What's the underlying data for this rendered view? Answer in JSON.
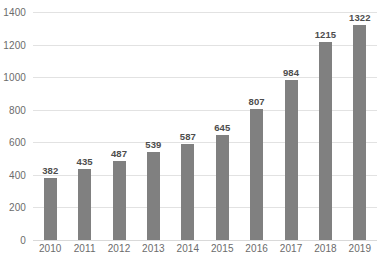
{
  "chart_data": {
    "type": "bar",
    "title": "",
    "subtitle": "",
    "xlabel": "",
    "ylabel": "",
    "categories": [
      "2010",
      "2011",
      "2012",
      "2013",
      "2014",
      "2015",
      "2016",
      "2017",
      "2018",
      "2019"
    ],
    "values": [
      382,
      435,
      487,
      539,
      587,
      645,
      807,
      984,
      1215,
      1322
    ],
    "data_labels": [
      "382",
      "435",
      "487",
      "539",
      "587",
      "645",
      "807",
      "984",
      "1215",
      "1322"
    ],
    "ylim": [
      0,
      1400
    ],
    "ytick_values": [
      0,
      200,
      400,
      600,
      800,
      1000,
      1200,
      1400
    ],
    "ytick_labels": [
      "0",
      "200",
      "400",
      "600",
      "800",
      "1000",
      "1200",
      "1400"
    ],
    "grid": "horizontal",
    "legend": "none",
    "series": [
      {
        "name": "",
        "values": [
          382,
          435,
          487,
          539,
          587,
          645,
          807,
          984,
          1215,
          1322
        ]
      }
    ],
    "colors": {
      "bar": "#808080",
      "gridline": "#e2e2e2",
      "axis_text": "#6b6b6b",
      "data_label": "#4d4d4d",
      "background": "#ffffff"
    }
  }
}
